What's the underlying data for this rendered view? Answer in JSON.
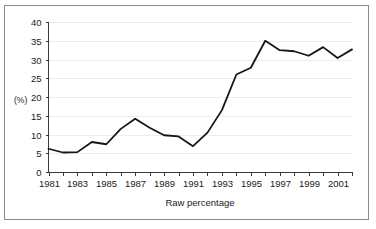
{
  "chart_data": {
    "type": "line",
    "title": "",
    "xlabel": "Raw percentage",
    "ylabel": "(%)",
    "x": [
      1981,
      1982,
      1983,
      1984,
      1985,
      1986,
      1987,
      1988,
      1989,
      1990,
      1991,
      1992,
      1993,
      1994,
      1995,
      1996,
      1997,
      1998,
      1999,
      2000,
      2001,
      2002
    ],
    "values": [
      6.2,
      5.2,
      5.3,
      8.0,
      7.4,
      11.5,
      14.2,
      11.8,
      9.8,
      9.5,
      6.9,
      10.5,
      16.5,
      26.0,
      27.8,
      35.0,
      32.5,
      32.2,
      31.0,
      33.3,
      30.4,
      32.7
    ],
    "series": [
      {
        "name": "Raw percentage",
        "values": [
          6.2,
          5.2,
          5.3,
          8.0,
          7.4,
          11.5,
          14.2,
          11.8,
          9.8,
          9.5,
          6.9,
          10.5,
          16.5,
          26.0,
          27.8,
          35.0,
          32.5,
          32.2,
          31.0,
          33.3,
          30.4,
          32.7
        ]
      }
    ],
    "ylim": [
      0,
      40
    ],
    "xlim": [
      1981,
      2002
    ],
    "ytick_labels": [
      "0",
      "5",
      "10",
      "15",
      "20",
      "25",
      "30",
      "35",
      "40"
    ],
    "ytick_values": [
      0,
      5,
      10,
      15,
      20,
      25,
      30,
      35,
      40
    ],
    "xtick_values": [
      1981,
      1982,
      1983,
      1984,
      1985,
      1986,
      1987,
      1988,
      1989,
      1990,
      1991,
      1992,
      1993,
      1994,
      1995,
      1996,
      1997,
      1998,
      1999,
      2000,
      2001,
      2002
    ],
    "xtick_labels": [
      "1981",
      "",
      "1983",
      "",
      "1985",
      "",
      "1987",
      "",
      "1989",
      "",
      "1991",
      "",
      "1993",
      "",
      "1995",
      "",
      "1997",
      "",
      "1999",
      "",
      "2001",
      ""
    ],
    "grid": true,
    "grid_axis": "y",
    "legend": false,
    "legend_position": "none",
    "line_color": "#161616",
    "grid_color": "#ededf0",
    "axis_color": "#3a3a3a",
    "background_color": "#ffffff"
  }
}
